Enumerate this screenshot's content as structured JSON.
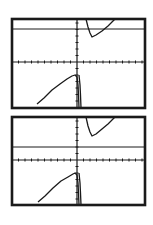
{
  "chart_data": [
    {
      "type": "line",
      "title": "",
      "xlabel": "",
      "ylabel": "",
      "grid": false,
      "legend": "none",
      "description": "Graphing-calculator window: rational function with vertical asymptote at x=0 and horizontal asymptote above the x-axis",
      "frame": {
        "x": 12,
        "y": 19,
        "w": 133,
        "h": 89
      },
      "axes": {
        "x_axis_y": 62,
        "y_axis_x": 77,
        "tick_spacing": 6.5
      },
      "horizontal_asymptote_y": 29,
      "series": [
        {
          "name": "upper-right-branch",
          "points": [
            [
              86,
              19
            ],
            [
              88,
              27
            ],
            [
              90,
              33
            ],
            [
              92,
              37
            ],
            [
              96,
              35
            ],
            [
              102,
              31
            ],
            [
              108,
              26
            ],
            [
              113,
              21
            ],
            [
              115,
              19
            ]
          ]
        },
        {
          "name": "lower-left-branch",
          "points": [
            [
              37,
              104
            ],
            [
              44,
              98
            ],
            [
              52,
              90
            ],
            [
              60,
              84
            ],
            [
              67,
              79
            ],
            [
              72,
              76
            ],
            [
              75,
              75
            ],
            [
              77,
              77
            ],
            [
              78,
              85
            ],
            [
              78.5,
              95
            ],
            [
              79,
              108
            ]
          ]
        },
        {
          "name": "near-asymptote-right",
          "points": [
            [
              79,
              75
            ],
            [
              80,
              85
            ],
            [
              80.5,
              95
            ],
            [
              81,
              108
            ]
          ]
        }
      ]
    },
    {
      "type": "line",
      "title": "",
      "xlabel": "",
      "ylabel": "",
      "grid": false,
      "legend": "none",
      "description": "Same rational function graph with horizontal asymptote drawn below the local minimum",
      "frame": {
        "x": 12,
        "y": 117,
        "w": 133,
        "h": 88
      },
      "axes": {
        "x_axis_y": 160,
        "y_axis_x": 77,
        "tick_spacing": 6.5
      },
      "horizontal_asymptote_y": 147,
      "series": [
        {
          "name": "upper-right-branch",
          "points": [
            [
              86,
              117
            ],
            [
              88,
              126
            ],
            [
              90,
              132
            ],
            [
              92,
              136
            ],
            [
              96,
              134
            ],
            [
              102,
              129
            ],
            [
              108,
              124
            ],
            [
              113,
              119
            ],
            [
              115,
              117
            ]
          ]
        },
        {
          "name": "lower-left-branch",
          "points": [
            [
              38,
              202
            ],
            [
              45,
              196
            ],
            [
              53,
              188
            ],
            [
              61,
              181
            ],
            [
              68,
              177
            ],
            [
              73,
              174
            ],
            [
              75,
              173
            ],
            [
              77,
              175
            ],
            [
              78,
              183
            ],
            [
              78.5,
              193
            ],
            [
              79,
              205
            ]
          ]
        },
        {
          "name": "near-asymptote-right",
          "points": [
            [
              79,
              173
            ],
            [
              80,
              183
            ],
            [
              80.5,
              193
            ],
            [
              81,
              205
            ]
          ]
        }
      ]
    }
  ],
  "colors": {
    "ink": "#1a1a1a",
    "background": "#ffffff"
  }
}
